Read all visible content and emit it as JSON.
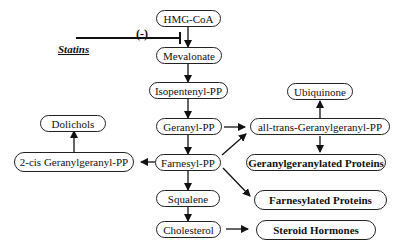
{
  "diagram": {
    "inhibitor": {
      "label": "Statins",
      "sign": "(-)"
    },
    "nodes": {
      "hmg_coa": "HMG-CoA",
      "mevalonate": "Mevalonate",
      "isopentenyl_pp": "Isopentenyl-PP",
      "geranyl_pp": "Geranyl-PP",
      "farnesyl_pp": "Farnesyl-PP",
      "squalene": "Squalene",
      "cholesterol": "Cholesterol",
      "dolichols": "Dolichols",
      "cis_ggpp": "2-cis Geranylgeranyl-PP",
      "ubiquinone": "Ubiquinone",
      "trans_ggpp": "all-trans-Geranylgeranyl-PP",
      "gg_proteins": "Geranylgeranylated Proteins",
      "f_proteins": "Farnesylated Proteins",
      "steroid_hormones": "Steroid Hormones"
    },
    "edges": [
      [
        "HMG-CoA",
        "Mevalonate"
      ],
      [
        "Mevalonate",
        "Isopentenyl-PP"
      ],
      [
        "Isopentenyl-PP",
        "Geranyl-PP"
      ],
      [
        "Geranyl-PP",
        "Farnesyl-PP"
      ],
      [
        "Geranyl-PP",
        "all-trans-Geranylgeranyl-PP"
      ],
      [
        "Farnesyl-PP",
        "all-trans-Geranylgeranyl-PP"
      ],
      [
        "Farnesyl-PP",
        "2-cis Geranylgeranyl-PP"
      ],
      [
        "2-cis Geranylgeranyl-PP",
        "Dolichols"
      ],
      [
        "Farnesyl-PP",
        "Squalene"
      ],
      [
        "Farnesyl-PP",
        "Farnesylated Proteins"
      ],
      [
        "Squalene",
        "Cholesterol"
      ],
      [
        "Cholesterol",
        "Steroid Hormones"
      ],
      [
        "all-trans-Geranylgeranyl-PP",
        "Ubiquinone"
      ],
      [
        "all-trans-Geranylgeranyl-PP",
        "Geranylgeranylated Proteins"
      ]
    ]
  }
}
